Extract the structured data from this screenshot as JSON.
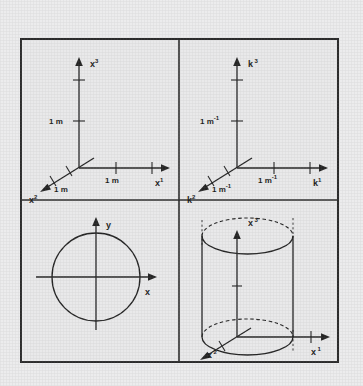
{
  "figure": {
    "background_color": "#ececed",
    "panel_color": "#e9e9ea",
    "ink_color": "#242424",
    "frame": {
      "x": 20,
      "y": 38,
      "width": 319,
      "height": 325
    }
  },
  "panels": [
    {
      "id": "real-space-axes",
      "position": "top-left",
      "description": "Three-dimensional real-space coordinate axes with metre tick marks",
      "axes": [
        {
          "name": "x3",
          "label": "x",
          "superscript": "3",
          "direction": "up"
        },
        {
          "name": "x1",
          "label": "x",
          "superscript": "1",
          "direction": "right"
        },
        {
          "name": "x2",
          "label": "x",
          "superscript": "2",
          "direction": "down-left"
        }
      ],
      "tick_labels": [
        {
          "axis": "x3",
          "text": "1 m"
        },
        {
          "axis": "x1",
          "text": "1 m"
        },
        {
          "axis": "x2",
          "text": "1 m"
        }
      ],
      "unit": "m",
      "ticks_per_axis": 2
    },
    {
      "id": "reciprocal-space-axes",
      "position": "top-right",
      "description": "Three-dimensional reciprocal-space coordinate axes with inverse-metre tick marks",
      "axes": [
        {
          "name": "k3",
          "label": "k",
          "superscript": "3",
          "direction": "up"
        },
        {
          "name": "k1",
          "label": "k",
          "superscript": "1",
          "direction": "right"
        },
        {
          "name": "k2",
          "label": "k",
          "superscript": "2",
          "direction": "down-left"
        }
      ],
      "tick_labels": [
        {
          "axis": "k3",
          "text": "1 m",
          "exponent": "-1"
        },
        {
          "axis": "k1",
          "text": "1 m",
          "exponent": "-1"
        },
        {
          "axis": "k2",
          "text": "1 m",
          "exponent": "-1"
        }
      ],
      "unit": "m-1",
      "ticks_per_axis": 2
    },
    {
      "id": "circle-plane",
      "position": "bottom-left",
      "description": "Circle centred on the origin of a two-dimensional x-y coordinate system",
      "axes": [
        {
          "name": "y",
          "label": "y",
          "superscript": "",
          "direction": "up"
        },
        {
          "name": "x",
          "label": "x",
          "superscript": "",
          "direction": "right"
        }
      ],
      "shape": "circle"
    },
    {
      "id": "cylinder-3d",
      "position": "bottom-right",
      "description": "Cylinder drawn about the x3 axis with hidden edges dashed",
      "axes": [
        {
          "name": "x3",
          "label": "x",
          "superscript": "3",
          "direction": "up"
        },
        {
          "name": "x1",
          "label": "x",
          "superscript": "1",
          "direction": "right"
        },
        {
          "name": "x2",
          "label": "x",
          "superscript": "2",
          "direction": "down-left"
        }
      ],
      "shape": "cylinder",
      "hidden_edge_style": "dashed"
    }
  ]
}
